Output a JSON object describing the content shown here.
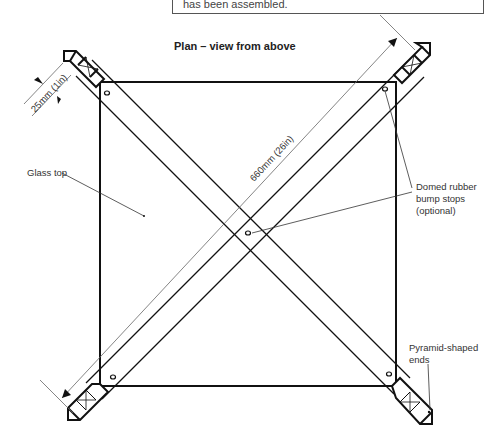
{
  "caption": {
    "text": "has been assembled."
  },
  "diagram": {
    "title": "Plan – view from above",
    "dimensions": {
      "leg_width": "25mm (1in)",
      "leg_length": "660mm (26in)"
    },
    "labels": {
      "glass_top": "Glass top",
      "bump_stops_line1": "Domed rubber",
      "bump_stops_line2": "bump stops",
      "bump_stops_line3": "(optional)",
      "ends_line1": "Pyramid-shaped",
      "ends_line2": "ends"
    },
    "colors": {
      "line": "#111111",
      "dim_line": "#666666",
      "text": "#333333"
    }
  }
}
